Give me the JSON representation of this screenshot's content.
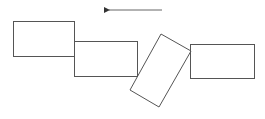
{
  "diagram": {
    "width": 265,
    "height": 119,
    "stroke_color": "#555555",
    "background": "#ffffff",
    "arrow": {
      "direction": "left",
      "x1": 162,
      "y1": 10,
      "x2": 105,
      "y2": 10
    },
    "blocks": [
      {
        "id": "block-1",
        "type": "rect",
        "x": 13,
        "y": 21,
        "w": 61,
        "h": 35
      },
      {
        "id": "block-2",
        "type": "rect",
        "x": 74,
        "y": 41,
        "w": 63,
        "h": 35
      },
      {
        "id": "block-3",
        "type": "rotated-rect",
        "points": "161,34 191,51 159,107 130,90"
      },
      {
        "id": "block-4",
        "type": "rect",
        "x": 190,
        "y": 44,
        "w": 64,
        "h": 34
      }
    ]
  }
}
